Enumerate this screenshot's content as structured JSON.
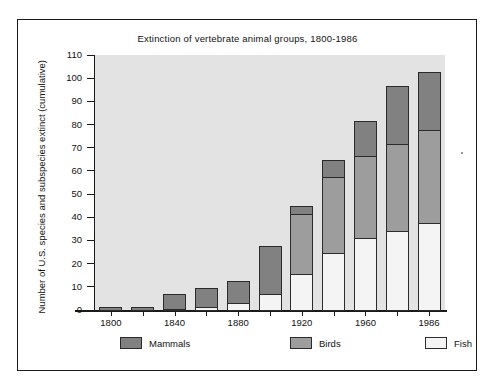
{
  "chart_data": {
    "type": "bar",
    "title": "Extinction of vertebrate animal groups, 1800-1986",
    "xlabel": "",
    "ylabel": "Number of U.S. species and subspecies extinct (cumulative)",
    "ylim": [
      0,
      110
    ],
    "yticks": [
      0,
      10,
      20,
      30,
      40,
      50,
      60,
      70,
      80,
      90,
      100,
      110
    ],
    "xtick_labels": [
      "1800",
      "1840",
      "1880",
      "1920",
      "1960",
      "1986"
    ],
    "grid": false,
    "stacked": true,
    "legend_position": "bottom",
    "categories": [
      "1800",
      "1820",
      "1840",
      "1860",
      "1880",
      "1900",
      "1920",
      "1940",
      "1960",
      "1980",
      "1986"
    ],
    "series": [
      {
        "name": "Fish",
        "color": "#f4f4f4",
        "values": [
          0,
          0,
          0.5,
          1.5,
          3,
          7,
          15.5,
          24.5,
          31,
          34,
          37.5
        ]
      },
      {
        "name": "Birds",
        "color": "#9d9d9d",
        "values": [
          0,
          0,
          0,
          0,
          0,
          0,
          26,
          33,
          35.5,
          37.5,
          40
        ]
      },
      {
        "name": "Mammals",
        "color": "#818181",
        "values": [
          1.5,
          1.5,
          6.5,
          8,
          9.5,
          20.5,
          3.5,
          7,
          15,
          25,
          25
        ]
      }
    ],
    "totals": [
      1.5,
      1.5,
      7,
      9.5,
      12.5,
      27.5,
      45,
      64.5,
      81.5,
      96.5,
      102.5
    ]
  },
  "legend": {
    "items": [
      {
        "label": "Mammals",
        "color": "#818181"
      },
      {
        "label": "Birds",
        "color": "#9d9d9d"
      },
      {
        "label": "Fish",
        "color": "#f4f4f4"
      }
    ]
  }
}
